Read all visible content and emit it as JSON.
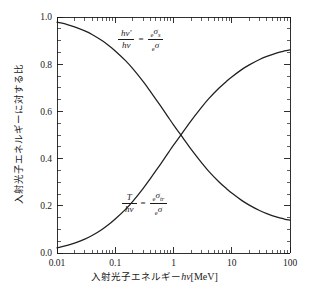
{
  "chart_data": {
    "type": "line",
    "title": "",
    "xlabel_plain": "入射光子エネルギー hν [MeV]",
    "ylabel_plain": "入射光子エネルギーに対する比",
    "xscale": "log",
    "yscale": "linear",
    "xlim": [
      0.01,
      100
    ],
    "ylim": [
      0.0,
      1.0
    ],
    "grid": false,
    "legend": "none",
    "xticks": [
      "0.01",
      "0.1",
      "1",
      "10",
      "100"
    ],
    "xtick_values": [
      0.01,
      0.1,
      1,
      10,
      100
    ],
    "yticks": [
      "0.0",
      "0.2",
      "0.4",
      "0.6",
      "0.8",
      "1.0"
    ],
    "ytick_values": [
      0.0,
      0.2,
      0.4,
      0.6,
      0.8,
      1.0
    ],
    "x": [
      0.01,
      0.015,
      0.02,
      0.03,
      0.04,
      0.06,
      0.08,
      0.1,
      0.15,
      0.2,
      0.3,
      0.4,
      0.6,
      0.8,
      1.0,
      1.5,
      2.0,
      3.0,
      4.0,
      6.0,
      8.0,
      10.0,
      15.0,
      20.0,
      30.0,
      40.0,
      60.0,
      80.0,
      100.0
    ],
    "series": [
      {
        "name": "scattered-photon-fraction",
        "label": "hν'/hν = eσs/eσ",
        "trend": "decreasing",
        "values": [
          0.978,
          0.968,
          0.958,
          0.941,
          0.926,
          0.899,
          0.876,
          0.856,
          0.815,
          0.781,
          0.727,
          0.685,
          0.623,
          0.578,
          0.543,
          0.483,
          0.44,
          0.384,
          0.347,
          0.302,
          0.274,
          0.254,
          0.222,
          0.203,
          0.18,
          0.167,
          0.152,
          0.144,
          0.139
        ]
      },
      {
        "name": "transferred-energy-fraction",
        "label": "T/hν = eσtr/eσ",
        "trend": "increasing",
        "values": [
          0.022,
          0.032,
          0.042,
          0.059,
          0.074,
          0.101,
          0.124,
          0.144,
          0.185,
          0.219,
          0.273,
          0.315,
          0.377,
          0.422,
          0.457,
          0.517,
          0.56,
          0.616,
          0.653,
          0.698,
          0.726,
          0.746,
          0.778,
          0.797,
          0.82,
          0.833,
          0.848,
          0.856,
          0.861
        ]
      }
    ],
    "crossing_point": {
      "x": 1.5,
      "y": 0.5
    },
    "annotations": [
      {
        "name": "upper-formula",
        "numerator_left": "hν′",
        "denominator_left": "hν",
        "relation": "=",
        "numerator_right": "ₑσₛ",
        "denominator_right": "ₑσ"
      },
      {
        "name": "lower-formula",
        "numerator_left": "T",
        "denominator_left": "hν",
        "relation": "=",
        "numerator_right": "ₑσ_tr",
        "denominator_right": "ₑσ"
      }
    ]
  },
  "axes": {
    "xlabel": {
      "jp_main": "入射光子エネルギー",
      "symbol": "hν",
      "unit": "[MeV]"
    },
    "ylabel": {
      "jp_main": "入射光子エネルギーに対する比"
    }
  },
  "formulas": {
    "top": {
      "num_left_h": "h",
      "num_left_nu": "ν",
      "num_left_prime": "′",
      "den_left_h": "h",
      "den_left_nu": "ν",
      "equals": "=",
      "num_right_pre": "e",
      "num_right_sigma": "σ",
      "num_right_sub": "s",
      "den_right_pre": "e",
      "den_right_sigma": "σ"
    },
    "bottom": {
      "num_left": "T",
      "den_left_h": "h",
      "den_left_nu": "ν",
      "equals": "=",
      "num_right_pre": "e",
      "num_right_sigma": "σ",
      "num_right_sub": "tr",
      "den_right_pre": "e",
      "den_right_sigma": "σ"
    }
  },
  "style": {
    "axis_color": "#1a1a1a",
    "curve_color": "#1f1f1f",
    "background": "#ffffff"
  }
}
